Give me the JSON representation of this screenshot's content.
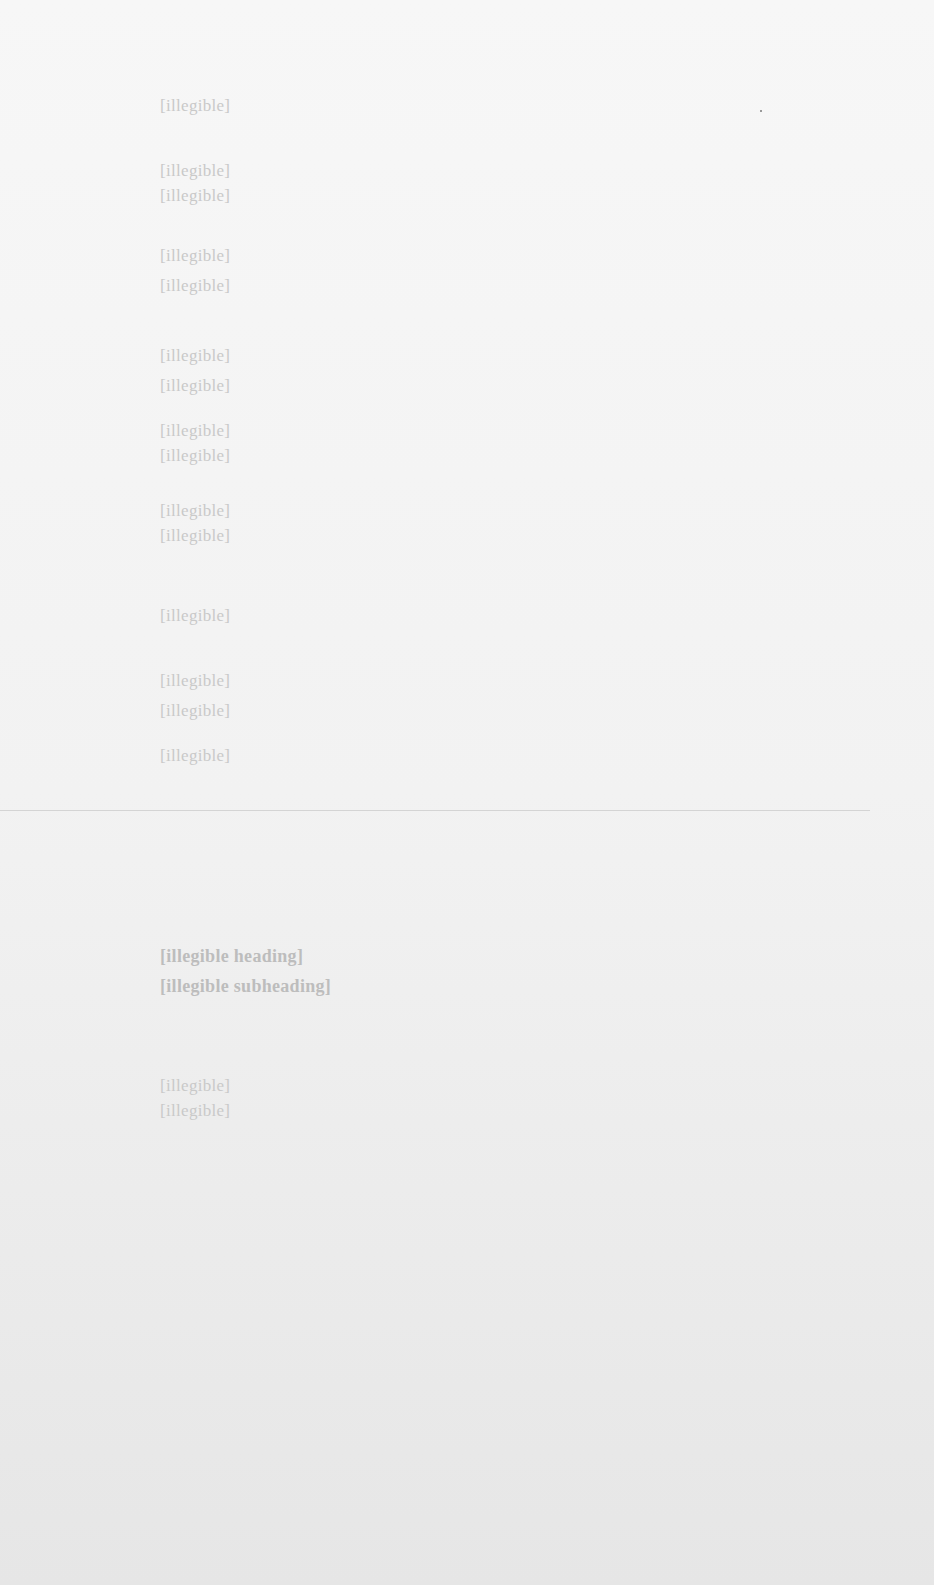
{
  "document": {
    "legibility": "text too faded to transcribe",
    "top_section": {
      "lines": [
        {
          "top": 95,
          "text": "[illegible]"
        },
        {
          "top": 160,
          "text": "[illegible]"
        },
        {
          "top": 185,
          "text": "[illegible]"
        },
        {
          "top": 245,
          "text": "[illegible]"
        },
        {
          "top": 275,
          "text": "[illegible]"
        },
        {
          "top": 345,
          "text": "[illegible]"
        },
        {
          "top": 375,
          "text": "[illegible]"
        },
        {
          "top": 420,
          "text": "[illegible]"
        },
        {
          "top": 445,
          "text": "[illegible]"
        },
        {
          "top": 500,
          "text": "[illegible]"
        },
        {
          "top": 525,
          "text": "[illegible]"
        },
        {
          "top": 605,
          "text": "[illegible]"
        },
        {
          "top": 670,
          "text": "[illegible]"
        },
        {
          "top": 700,
          "text": "[illegible]"
        },
        {
          "top": 745,
          "text": "[illegible]"
        }
      ]
    },
    "heading": {
      "line1": "[illegible heading]",
      "line2": "[illegible subheading]"
    },
    "bottom_section": {
      "lines": [
        {
          "top": 1075,
          "text": "[illegible]"
        },
        {
          "top": 1100,
          "text": "[illegible]"
        }
      ]
    }
  }
}
